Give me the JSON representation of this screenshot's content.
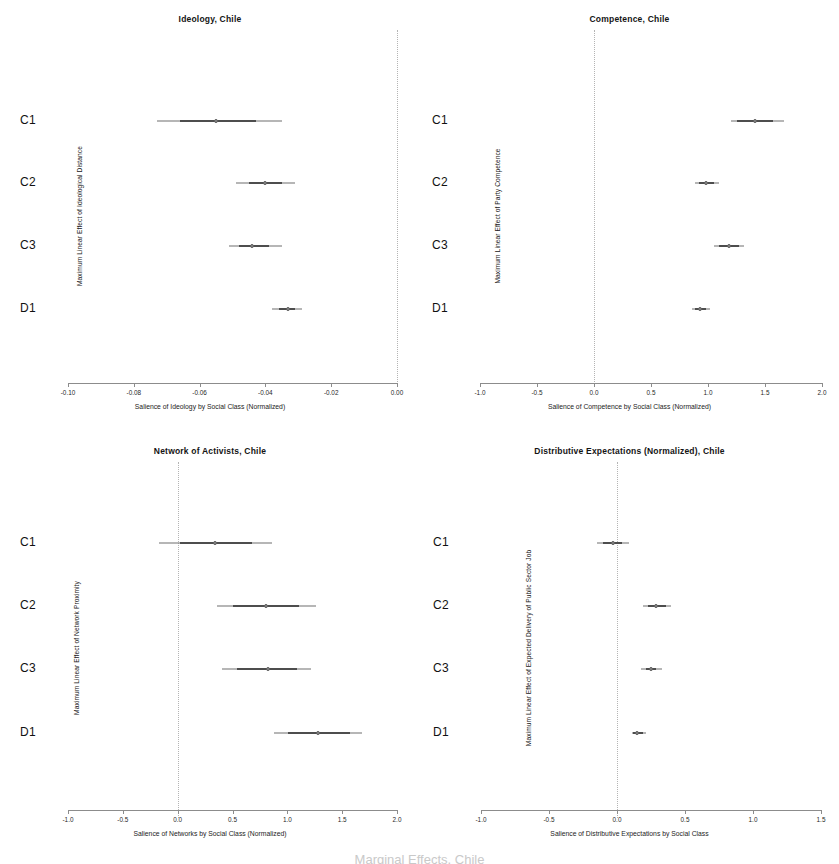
{
  "figure": {
    "footnote": "Marginal Effects, Chile"
  },
  "chart_data": [
    {
      "id": "ideology-chile",
      "type": "scatter",
      "title": "Ideology, Chile",
      "xlabel": "Salience of Ideology by Social Class (Normalized)",
      "ylabel": "Maximum Linear Effect of Ideological Distance",
      "xlim": [
        -0.1,
        0.0
      ],
      "xticks": [
        -0.1,
        -0.08,
        -0.06,
        -0.04,
        -0.02,
        0.0
      ],
      "xticklabels": [
        "-0.10",
        "-0.08",
        "-0.06",
        "-0.04",
        "-0.02",
        "0.00"
      ],
      "categories": [
        "C1",
        "C2",
        "C3",
        "D1"
      ],
      "refline": 0.0,
      "grid": false,
      "legend": "none",
      "points": [
        {
          "category": "C1",
          "estimate": -0.055,
          "inner_low": -0.066,
          "inner_high": -0.043,
          "outer_low": -0.073,
          "outer_high": -0.035
        },
        {
          "category": "C2",
          "estimate": -0.04,
          "inner_low": -0.045,
          "inner_high": -0.035,
          "outer_low": -0.049,
          "outer_high": -0.031
        },
        {
          "category": "C3",
          "estimate": -0.044,
          "inner_low": -0.048,
          "inner_high": -0.039,
          "outer_low": -0.051,
          "outer_high": -0.035
        },
        {
          "category": "D1",
          "estimate": -0.033,
          "inner_low": -0.036,
          "inner_high": -0.031,
          "outer_low": -0.038,
          "outer_high": -0.029
        }
      ]
    },
    {
      "id": "competence-chile",
      "type": "scatter",
      "title": "Competence, Chile",
      "xlabel": "Salience of Competence by Social Class (Normalized)",
      "ylabel": "Maximum Linear Effect of Party Competence",
      "xlim": [
        -1.0,
        2.0
      ],
      "xticks": [
        -1.0,
        -0.5,
        0.0,
        0.5,
        1.0,
        1.5,
        2.0
      ],
      "xticklabels": [
        "-1.0",
        "-0.5",
        "0.0",
        "0.5",
        "1.0",
        "1.5",
        "2.0"
      ],
      "categories": [
        "C1",
        "C2",
        "C3",
        "D1"
      ],
      "refline": 0.0,
      "grid": false,
      "legend": "none",
      "points": [
        {
          "category": "C1",
          "estimate": 1.41,
          "inner_low": 1.25,
          "inner_high": 1.57,
          "outer_low": 1.2,
          "outer_high": 1.67
        },
        {
          "category": "C2",
          "estimate": 0.98,
          "inner_low": 0.92,
          "inner_high": 1.05,
          "outer_low": 0.89,
          "outer_high": 1.1
        },
        {
          "category": "C3",
          "estimate": 1.18,
          "inner_low": 1.1,
          "inner_high": 1.27,
          "outer_low": 1.05,
          "outer_high": 1.32
        },
        {
          "category": "D1",
          "estimate": 0.93,
          "inner_low": 0.89,
          "inner_high": 0.98,
          "outer_low": 0.86,
          "outer_high": 1.02
        }
      ]
    },
    {
      "id": "network-of-activists-chile",
      "type": "scatter",
      "title": "Network of Activists, Chile",
      "xlabel": "Salience of Networks by Social Class  (Normalized)",
      "ylabel": "Maximum Linear Effect of Network Proximity",
      "xlim": [
        -1.0,
        2.0
      ],
      "xticks": [
        -1.0,
        -0.5,
        0.0,
        0.5,
        1.0,
        1.5,
        2.0
      ],
      "xticklabels": [
        "-1.0",
        "-0.5",
        "0.0",
        "0.5",
        "1.0",
        "1.5",
        "2.0"
      ],
      "categories": [
        "C1",
        "C2",
        "C3",
        "D1"
      ],
      "refline": 0.0,
      "grid": false,
      "legend": "none",
      "points": [
        {
          "category": "C1",
          "estimate": 0.34,
          "inner_low": 0.02,
          "inner_high": 0.68,
          "outer_low": -0.17,
          "outer_high": 0.86
        },
        {
          "category": "C2",
          "estimate": 0.81,
          "inner_low": 0.5,
          "inner_high": 1.11,
          "outer_low": 0.36,
          "outer_high": 1.26
        },
        {
          "category": "C3",
          "estimate": 0.82,
          "inner_low": 0.54,
          "inner_high": 1.09,
          "outer_low": 0.4,
          "outer_high": 1.22
        },
        {
          "category": "D1",
          "estimate": 1.28,
          "inner_low": 1.01,
          "inner_high": 1.57,
          "outer_low": 0.88,
          "outer_high": 1.68
        }
      ]
    },
    {
      "id": "distributive-expectations-chile",
      "type": "scatter",
      "title": "Distributive Expectations (Normalized), Chile",
      "xlabel": "Salience of Distributive Expectations by Social Class",
      "ylabel": "Maximum Linear Effect of Expected Delivery of Public Sector Job",
      "xlim": [
        -1.0,
        1.5
      ],
      "xticks": [
        -1.0,
        -0.5,
        0.0,
        0.5,
        1.0,
        1.5
      ],
      "xticklabels": [
        "-1.0",
        "-0.5",
        "0.0",
        "0.5",
        "1.0",
        "1.5"
      ],
      "categories": [
        "C1",
        "C2",
        "C3",
        "D1"
      ],
      "refline": 0.0,
      "grid": false,
      "legend": "none",
      "points": [
        {
          "category": "C1",
          "estimate": -0.03,
          "inner_low": -0.1,
          "inner_high": 0.04,
          "outer_low": -0.15,
          "outer_high": 0.09
        },
        {
          "category": "C2",
          "estimate": 0.29,
          "inner_low": 0.23,
          "inner_high": 0.36,
          "outer_low": 0.19,
          "outer_high": 0.4
        },
        {
          "category": "C3",
          "estimate": 0.25,
          "inner_low": 0.21,
          "inner_high": 0.29,
          "outer_low": 0.18,
          "outer_high": 0.33
        },
        {
          "category": "D1",
          "estimate": 0.15,
          "inner_low": 0.12,
          "inner_high": 0.19,
          "outer_low": 0.11,
          "outer_high": 0.21
        }
      ]
    }
  ]
}
